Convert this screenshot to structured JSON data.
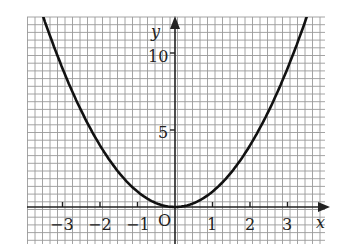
{
  "chart_data": {
    "type": "line",
    "title": "",
    "function": "y = x^2",
    "xlabel": "x",
    "ylabel": "y",
    "origin_label": "O",
    "xlim": [
      -3.9,
      4.0
    ],
    "ylim": [
      -2.4,
      12.3
    ],
    "x_ticks": [
      "-3",
      "-2",
      "-1",
      "1",
      "2",
      "3"
    ],
    "y_ticks": [
      "5",
      "10"
    ],
    "grid": true,
    "series": [
      {
        "name": "parabola",
        "x": [
          -3.5,
          -3,
          -2.5,
          -2,
          -1.5,
          -1,
          -0.5,
          0,
          0.5,
          1,
          1.5,
          2,
          2.5,
          3,
          3.5
        ],
        "values": [
          12.25,
          9,
          6.25,
          4,
          2.25,
          1,
          0.25,
          0,
          0.25,
          1,
          2.25,
          4,
          6.25,
          9,
          12.25
        ]
      }
    ]
  },
  "labels": {
    "x_axis": "x",
    "y_axis": "y",
    "origin": "O",
    "xt": [
      "−3",
      "−2",
      "−1",
      "1",
      "2",
      "3"
    ],
    "yt": [
      "5",
      "10"
    ]
  }
}
